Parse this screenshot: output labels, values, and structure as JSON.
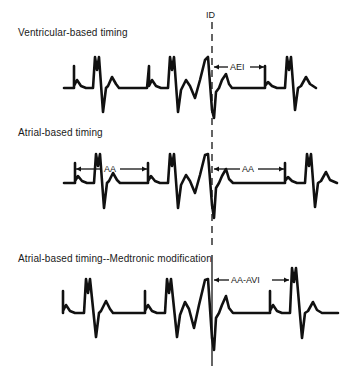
{
  "figure": {
    "id_marker": {
      "label": "ID",
      "x": 212
    },
    "panels": [
      {
        "title": "Ventricular-based timing",
        "interval_label": "AEI",
        "baseline_y": 88,
        "interval": {
          "from_x": 212,
          "to_x": 265,
          "y": 67
        }
      },
      {
        "title": "Atrial-based timing",
        "interval_label": "AA",
        "baseline_y": 183,
        "intervals": [
          {
            "label": "AA",
            "from_x": 75,
            "to_x": 148,
            "y": 169
          },
          {
            "label": "AA",
            "from_x": 212,
            "to_x": 285,
            "y": 169
          }
        ]
      },
      {
        "title": "Atrial-based timing--Medtronic modification",
        "interval_label": "AA-AVI",
        "baseline_y": 313,
        "interval": {
          "from_x": 212,
          "to_x": 290,
          "y": 280
        }
      }
    ]
  },
  "colors": {
    "ink": "#111111",
    "background": "#ffffff"
  }
}
